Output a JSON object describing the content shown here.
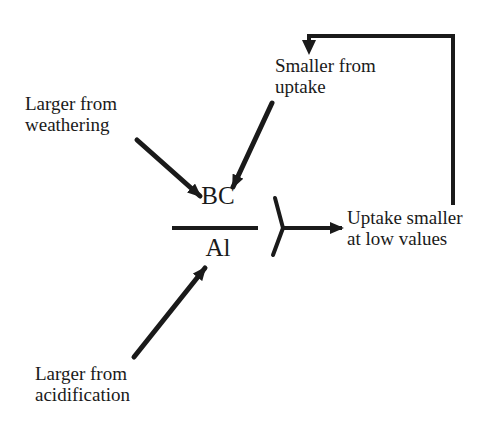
{
  "diagram": {
    "ratio": {
      "numerator": "BC",
      "denominator": "Al"
    },
    "influences": {
      "weathering": {
        "line1": "Larger from",
        "line2": "weathering"
      },
      "uptake": {
        "line1": "Smaller from",
        "line2": "uptake"
      },
      "acidification": {
        "line1": "Larger from",
        "line2": "acidification"
      }
    },
    "outcome": {
      "line1": "Uptake smaller",
      "line2": "at low values"
    },
    "colors": {
      "ink": "#1a1a1a",
      "background": "#ffffff"
    }
  }
}
